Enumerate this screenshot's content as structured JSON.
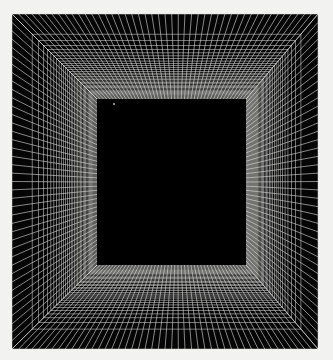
{
  "artwork": {
    "title": "Square Tunnel Vortex",
    "medium": "Op-art line drawing",
    "type": "radial-square-perspective-grid",
    "canvas": {
      "width": 333,
      "height": 360,
      "background_color": "#f2f2f0"
    },
    "frame": {
      "outer_left": 12,
      "outer_top": 14,
      "outer_right": 318,
      "outer_bottom": 349,
      "fill_color": "#050505",
      "border_color": "#0a0a0a"
    },
    "inner_square": {
      "left": 97,
      "top": 99,
      "right": 246,
      "bottom": 265,
      "fill_color": "#000000",
      "label": "inner-void"
    },
    "lines": {
      "color": "#e8e8e6",
      "stroke_width": 0.62,
      "opacity": 0.92,
      "radial_count_top": 46,
      "radial_count_bottom": 46,
      "radial_count_left": 40,
      "radial_count_right": 40,
      "ring_count": 34,
      "ring_compression_exponent": 2.45,
      "ring_color": "#dededc",
      "ring_stroke_width": 0.55
    },
    "speck": {
      "x": 114,
      "y": 104,
      "radius": 0.9,
      "color": "#c8c8c4",
      "label": "bright-speck-artifact"
    }
  }
}
